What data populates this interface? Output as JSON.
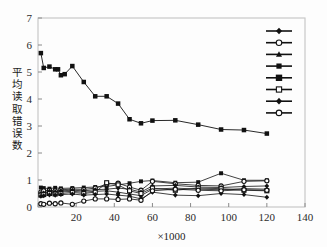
{
  "chart_data": {
    "type": "line",
    "title": "",
    "subtitle": "",
    "xlabel": "×1000",
    "ylabel": "平均读取错误数",
    "xlim": [
      0,
      140
    ],
    "ylim": [
      0,
      7
    ],
    "xticks": [
      0,
      20,
      40,
      60,
      80,
      100,
      120,
      140
    ],
    "xticklabels": [
      "",
      "20",
      "40",
      "60",
      "80",
      "100",
      "120",
      "140"
    ],
    "yticks": [
      0,
      1,
      2,
      3,
      4,
      5,
      6,
      7
    ],
    "yticklabels": [
      "0",
      "1",
      "2",
      "3",
      "4",
      "5",
      "6",
      "7"
    ],
    "grid": false,
    "legend_position": "upper-right-inside",
    "legend_entries": [
      {
        "label": "",
        "marker": "filled-diamond"
      },
      {
        "label": "",
        "marker": "open-circle"
      },
      {
        "label": "",
        "marker": "filled-triangle"
      },
      {
        "label": "",
        "marker": "filled-square"
      },
      {
        "label": "",
        "marker": "filled-square-large"
      },
      {
        "label": "",
        "marker": "open-square"
      },
      {
        "label": "",
        "marker": "filled-diamond"
      },
      {
        "label": "",
        "marker": "open-circle"
      }
    ],
    "series": [
      {
        "name": "series-1",
        "marker": "filled-square",
        "x": [
          1.5,
          3,
          6,
          9,
          10.5,
          12,
          14,
          18,
          24,
          30,
          36,
          42,
          48,
          54,
          60,
          72,
          84,
          96,
          108,
          120
        ],
        "values": [
          5.7,
          5.15,
          5.2,
          5.1,
          5.1,
          4.88,
          4.92,
          5.22,
          4.63,
          4.1,
          4.1,
          3.83,
          3.25,
          3.1,
          3.2,
          3.21,
          3.05,
          2.87,
          2.85,
          2.72
        ]
      },
      {
        "name": "series-2",
        "marker": "filled-square",
        "x": [
          1.5,
          3,
          6,
          9,
          12,
          18,
          24,
          30,
          36,
          42,
          48,
          54,
          60,
          72,
          84,
          96,
          108,
          120
        ],
        "values": [
          0.72,
          0.7,
          0.68,
          0.71,
          0.69,
          0.7,
          0.72,
          0.74,
          0.76,
          0.82,
          0.88,
          0.95,
          0.98,
          0.9,
          0.92,
          1.25,
          0.99,
          0.99
        ]
      },
      {
        "name": "series-3",
        "marker": "open-circle",
        "x": [
          1.5,
          3,
          6,
          9,
          12,
          18,
          24,
          30,
          36,
          42,
          48,
          54,
          60,
          72,
          84,
          96,
          108,
          120
        ],
        "values": [
          0.55,
          0.6,
          0.62,
          0.6,
          0.64,
          0.66,
          0.65,
          0.7,
          0.85,
          0.88,
          0.74,
          0.62,
          0.95,
          0.86,
          0.8,
          0.78,
          0.95,
          0.97
        ]
      },
      {
        "name": "series-4",
        "marker": "filled-diamond",
        "x": [
          1.5,
          3,
          6,
          9,
          12,
          18,
          24,
          30,
          36,
          42,
          48,
          54,
          60,
          72,
          84,
          96,
          108,
          120
        ],
        "values": [
          0.5,
          0.52,
          0.58,
          0.56,
          0.6,
          0.62,
          0.6,
          0.64,
          0.66,
          0.7,
          0.66,
          0.55,
          0.78,
          0.8,
          0.74,
          0.72,
          0.76,
          0.78
        ]
      },
      {
        "name": "series-5",
        "marker": "filled-triangle",
        "x": [
          1.5,
          3,
          6,
          9,
          12,
          18,
          24,
          30,
          36,
          42,
          48,
          54,
          60,
          72,
          84,
          96,
          108,
          120
        ],
        "values": [
          0.48,
          0.5,
          0.55,
          0.52,
          0.56,
          0.58,
          0.55,
          0.58,
          0.6,
          0.55,
          0.48,
          0.42,
          0.66,
          0.7,
          0.66,
          0.64,
          0.68,
          0.66
        ]
      },
      {
        "name": "series-6",
        "marker": "open-square",
        "x": [
          1.5,
          3,
          6,
          9,
          12,
          18,
          24,
          30,
          36,
          42,
          48,
          54,
          60,
          72,
          84,
          96,
          108,
          120
        ],
        "values": [
          0.44,
          0.46,
          0.5,
          0.48,
          0.5,
          0.54,
          0.5,
          0.55,
          0.9,
          0.82,
          0.6,
          0.5,
          0.7,
          0.62,
          0.7,
          0.68,
          0.62,
          0.6
        ]
      },
      {
        "name": "series-7",
        "marker": "filled-diamond",
        "x": [
          1.5,
          3,
          6,
          9,
          12,
          18,
          24,
          30,
          36,
          42,
          48,
          54,
          60,
          72,
          84,
          96,
          108,
          120
        ],
        "values": [
          0.4,
          0.42,
          0.45,
          0.44,
          0.46,
          0.48,
          0.44,
          0.46,
          0.48,
          0.44,
          0.4,
          0.3,
          0.55,
          0.44,
          0.42,
          0.5,
          0.46,
          0.36
        ]
      },
      {
        "name": "series-8",
        "marker": "open-circle",
        "x": [
          1.5,
          3,
          6,
          9,
          12,
          18,
          24,
          30,
          36,
          42,
          48,
          54,
          60,
          72,
          84,
          96,
          108,
          120
        ],
        "values": [
          0.12,
          0.1,
          0.14,
          0.12,
          0.15,
          0.1,
          0.22,
          0.3,
          0.3,
          0.28,
          0.3,
          0.25,
          0.6,
          0.66,
          0.62,
          0.6,
          0.64,
          0.62
        ]
      }
    ],
    "colors": {
      "data": "#111111",
      "frame": "#c9c9c9",
      "background": "#fdfdfd",
      "text": "#1f1f1f"
    }
  }
}
